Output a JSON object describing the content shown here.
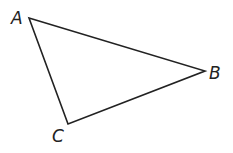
{
  "diagram": {
    "type": "triangle",
    "vertices": [
      {
        "label": "A",
        "x": 29,
        "y": 18
      },
      {
        "label": "B",
        "x": 205,
        "y": 71
      },
      {
        "label": "C",
        "x": 68,
        "y": 124
      }
    ],
    "stroke_color": "#222222"
  }
}
